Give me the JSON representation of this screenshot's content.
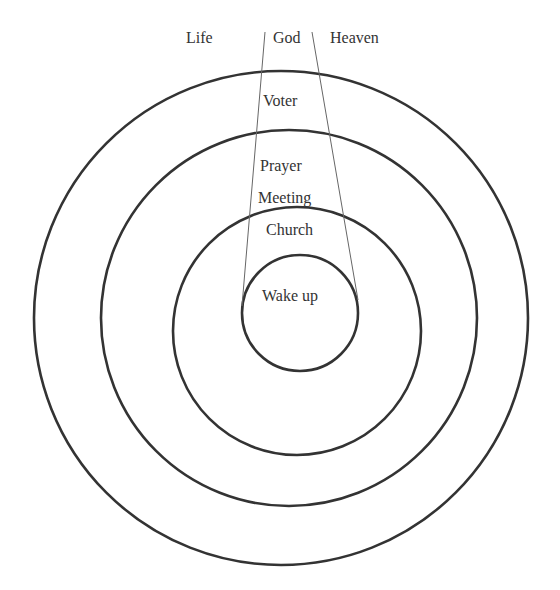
{
  "diagram": {
    "type": "concentric-circles",
    "top_labels": {
      "left": "Life",
      "center": "God",
      "right": "Heaven"
    },
    "ring_labels": {
      "outer": "Voter",
      "second_line1": "Prayer",
      "second_line2": "Meeting",
      "third": "Church",
      "inner": "Wake up"
    },
    "circles": [
      {
        "name": "outer",
        "cx": 281,
        "cy": 318,
        "r": 247
      },
      {
        "name": "second",
        "cx": 289,
        "cy": 318,
        "r": 188
      },
      {
        "name": "third",
        "cx": 297,
        "cy": 331,
        "r": 124
      },
      {
        "name": "inner",
        "cx": 300,
        "cy": 313,
        "r": 58
      }
    ],
    "funnel_lines": [
      {
        "x1": 265,
        "y1": 32,
        "x2": 242,
        "y2": 306
      },
      {
        "x1": 312,
        "y1": 32,
        "x2": 358,
        "y2": 300
      }
    ],
    "colors": {
      "stroke": "#333333",
      "thin_stroke": "#555555",
      "text": "#333333"
    }
  }
}
